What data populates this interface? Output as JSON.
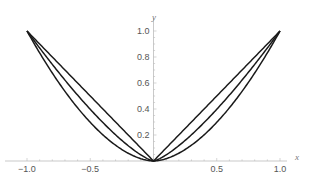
{
  "chart_data": {
    "type": "line",
    "title": "",
    "xlabel": "x",
    "ylabel": "y",
    "xlim": [
      -1.0,
      1.0
    ],
    "ylim": [
      0,
      1.0
    ],
    "grid": false,
    "legend": null,
    "x_ticks": [
      -1.0,
      -0.5,
      0.5,
      1.0
    ],
    "x_tick_labels": [
      "−1.0",
      "−0.5",
      "0.5",
      "1.0"
    ],
    "y_ticks": [
      0.2,
      0.4,
      0.6,
      0.8,
      1.0
    ],
    "y_tick_labels": [
      "0.2",
      "0.4",
      "0.6",
      "0.8",
      "1.0"
    ],
    "series": [
      {
        "name": "|x|^1",
        "exponent": 1.0,
        "color": "#1a1a1a",
        "x": [
          -1.0,
          -0.5,
          0,
          0.5,
          1.0
        ],
        "values": [
          1.0,
          0.5,
          0,
          0.5,
          1.0
        ]
      },
      {
        "name": "|x|^1.33",
        "exponent": 1.33,
        "color": "#1a1a1a",
        "x": [
          -1.0,
          -0.5,
          0,
          0.5,
          1.0
        ],
        "values": [
          1.0,
          0.4,
          0,
          0.4,
          1.0
        ]
      },
      {
        "name": "|x|^1.75",
        "exponent": 1.75,
        "color": "#1a1a1a",
        "x": [
          -1.0,
          -0.5,
          0,
          0.5,
          1.0
        ],
        "values": [
          1.0,
          0.3,
          0,
          0.3,
          1.0
        ]
      }
    ]
  }
}
